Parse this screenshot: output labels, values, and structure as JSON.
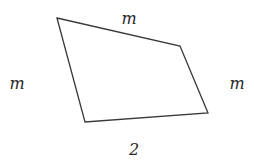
{
  "diagram": {
    "type": "quadrilateral",
    "vertices": [
      {
        "id": "A",
        "x": 57,
        "y": 18
      },
      {
        "id": "B",
        "x": 180,
        "y": 46
      },
      {
        "id": "C",
        "x": 208,
        "y": 113
      },
      {
        "id": "D",
        "x": 85,
        "y": 122
      }
    ],
    "edge_color": "#3a3a3a",
    "label_color": "#2a2a2a",
    "labels": {
      "top": {
        "text": "m",
        "x": 129,
        "y": 24
      },
      "left": {
        "text": "m",
        "x": 17,
        "y": 89
      },
      "right": {
        "text": "m",
        "x": 237,
        "y": 89
      },
      "bottom": {
        "text": "2",
        "x": 134,
        "y": 155
      }
    }
  }
}
